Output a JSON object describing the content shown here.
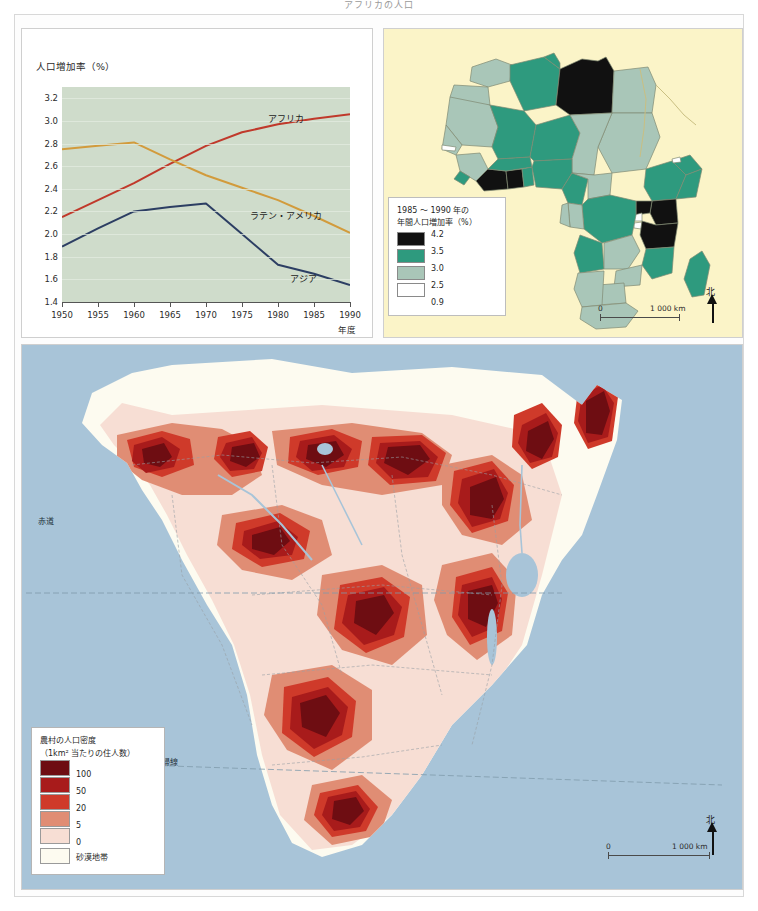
{
  "page": {
    "title": "アフリカの人口"
  },
  "chart_data": {
    "type": "line",
    "title": "",
    "ylabel": "人口増加率（%）",
    "xlabel": "年度",
    "x": [
      1950,
      1955,
      1960,
      1965,
      1970,
      1975,
      1980,
      1985,
      1990
    ],
    "xticks": [
      "1950",
      "1955",
      "1960",
      "1965",
      "1970",
      "1975",
      "1980",
      "1985",
      "1990"
    ],
    "yticks": [
      "3.2",
      "3.0",
      "2.8",
      "2.6",
      "2.4",
      "2.2",
      "2.0",
      "1.8",
      "1.6",
      "1.4"
    ],
    "ylim": [
      1.4,
      3.3
    ],
    "xlim": [
      1950,
      1990
    ],
    "grid": true,
    "legend_position": "inline-labels",
    "plot_background": "#cfdccb",
    "series": [
      {
        "name": "アフリカ",
        "color": "#c0392b",
        "values": [
          2.15,
          2.3,
          2.45,
          2.62,
          2.78,
          2.9,
          2.97,
          3.02,
          3.06
        ]
      },
      {
        "name": "ラテン・アメリカ",
        "color": "#d29b3c",
        "values": [
          2.75,
          2.78,
          2.81,
          2.66,
          2.52,
          2.41,
          2.3,
          2.16,
          2.01
        ]
      },
      {
        "name": "アジア",
        "color": "#2c3e63",
        "values": [
          1.89,
          2.05,
          2.2,
          2.24,
          2.27,
          2.0,
          1.73,
          1.65,
          1.55
        ]
      }
    ]
  },
  "africa_map": {
    "background": "#fbf4c8",
    "legend": {
      "title_line1": "1985 ～ 1990 年の",
      "title_line2": "年間人口増加率（%）",
      "items": [
        {
          "value": "4.2",
          "color": "#111111"
        },
        {
          "value": "3.5",
          "color": "#2e9a7e"
        },
        {
          "value": "3.0",
          "color": "#a9c6b8"
        },
        {
          "value": "2.5",
          "color": "#ffffff"
        },
        {
          "value": "0.9",
          "color": "#ffffff"
        }
      ]
    },
    "scalebar": {
      "start": "0",
      "end": "1 000 km"
    },
    "north": {
      "label": "北"
    }
  },
  "density_map": {
    "background": "#a8c4d8",
    "legend": {
      "title_line1": "農村の人口密度",
      "title_line2": "（1km² 当たりの住人数）",
      "items": [
        {
          "value": "100",
          "color": "#6e0d12"
        },
        {
          "value": "50",
          "color": "#a81b1b"
        },
        {
          "value": "20",
          "color": "#cf3a2a"
        },
        {
          "value": "5",
          "color": "#e08d74"
        },
        {
          "value": "0",
          "color": "#f7ded4"
        }
      ],
      "desert": {
        "label": "砂漠地帯",
        "color": "#fdfbf0"
      }
    },
    "geo_labels": {
      "equator": "赤道",
      "tropic_capricorn": "南回帰線"
    },
    "scalebar": {
      "start": "0",
      "end": "1 000 km"
    },
    "north": {
      "label": "北"
    }
  }
}
